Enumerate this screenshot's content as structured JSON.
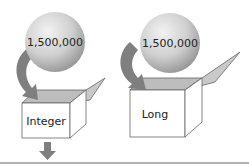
{
  "diagram": {
    "left": {
      "value_label": "1,500,000",
      "box_label": "Integer",
      "overflow_arrow": "down"
    },
    "right": {
      "value_label": "1,500,000",
      "box_label": "Long"
    },
    "colors": {
      "sphere_light": "#e6e6e6",
      "sphere_dark": "#9a9a9a",
      "arrow": "#7f7f7f",
      "box_stroke": "#666666",
      "box_inner": "#bdbdbd",
      "flap": "#c8c8c8",
      "baseline": "#666666"
    }
  }
}
